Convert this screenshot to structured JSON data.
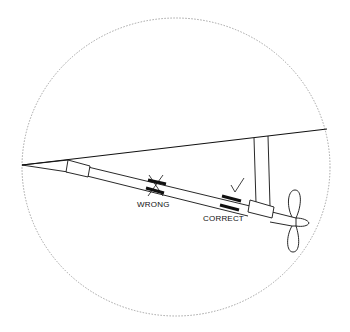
{
  "diagram": {
    "type": "propeller-shaft-coupling-alignment",
    "labels": {
      "wrong": "WRONG",
      "correct": "CORRECT"
    },
    "marks": {
      "wrong": "cross-mark",
      "correct": "check-mark"
    },
    "colors": {
      "line": "#111111",
      "circle": "#9a9a9a",
      "background": "#ffffff"
    }
  }
}
